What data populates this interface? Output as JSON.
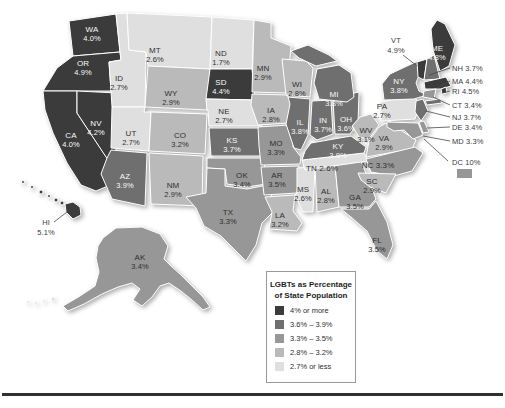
{
  "legend": {
    "title_line1": "LGBTs as Percentage",
    "title_line2": "of State Population",
    "items": [
      {
        "key": "cat1",
        "label": "4% or more",
        "color": "#3b3b3b"
      },
      {
        "key": "cat2",
        "label": "3.6% – 3.9%",
        "color": "#6f6f6f"
      },
      {
        "key": "cat3",
        "label": "3.3% – 3.5%",
        "color": "#979797"
      },
      {
        "key": "cat4",
        "label": "2.8% – 3.2%",
        "color": "#bababa"
      },
      {
        "key": "cat5",
        "label": "2.7% or less",
        "color": "#dfdfdf"
      }
    ]
  },
  "map": {
    "label_colors": {
      "on_dark": "#fafafa",
      "on_light": "#2f2f2f"
    },
    "states": [
      {
        "abbr": "WA",
        "value": "4.0%",
        "category": "cat1",
        "label": {
          "x": 92,
          "y": 29
        }
      },
      {
        "abbr": "OR",
        "value": "4.9%",
        "category": "cat1",
        "label": {
          "x": 83,
          "y": 63
        }
      },
      {
        "abbr": "CA",
        "value": "4.0%",
        "category": "cat1",
        "label": {
          "x": 71,
          "y": 135
        }
      },
      {
        "abbr": "NV",
        "value": "4.2%",
        "category": "cat1",
        "label": {
          "x": 96,
          "y": 123
        }
      },
      {
        "abbr": "ID",
        "value": "2.7%",
        "category": "cat5",
        "label": {
          "x": 119,
          "y": 78
        }
      },
      {
        "abbr": "UT",
        "value": "2.7%",
        "category": "cat5",
        "label": {
          "x": 131,
          "y": 133
        }
      },
      {
        "abbr": "AZ",
        "value": "3.9%",
        "category": "cat2",
        "label": {
          "x": 125,
          "y": 176
        }
      },
      {
        "abbr": "MT",
        "value": "2.6%",
        "category": "cat5",
        "label": {
          "x": 155,
          "y": 50
        }
      },
      {
        "abbr": "WY",
        "value": "2.9%",
        "category": "cat4",
        "label": {
          "x": 171,
          "y": 93
        }
      },
      {
        "abbr": "CO",
        "value": "3.2%",
        "category": "cat4",
        "label": {
          "x": 180,
          "y": 135
        }
      },
      {
        "abbr": "NM",
        "value": "2.9%",
        "category": "cat4",
        "label": {
          "x": 173,
          "y": 185
        }
      },
      {
        "abbr": "ND",
        "value": "1.7%",
        "category": "cat5",
        "label": {
          "x": 221,
          "y": 53
        }
      },
      {
        "abbr": "SD",
        "value": "4.4%",
        "category": "cat1",
        "label": {
          "x": 221,
          "y": 82
        }
      },
      {
        "abbr": "NE",
        "value": "2.7%",
        "category": "cat5",
        "label": {
          "x": 224,
          "y": 111
        }
      },
      {
        "abbr": "KS",
        "value": "3.7%",
        "category": "cat2",
        "label": {
          "x": 232,
          "y": 140
        }
      },
      {
        "abbr": "OK",
        "value": "3.4%",
        "category": "cat3",
        "label": {
          "x": 242,
          "y": 175
        }
      },
      {
        "abbr": "TX",
        "value": "3.3%",
        "category": "cat3",
        "label": {
          "x": 228,
          "y": 212
        }
      },
      {
        "abbr": "MN",
        "value": "2.9%",
        "category": "cat4",
        "label": {
          "x": 263,
          "y": 68
        }
      },
      {
        "abbr": "IA",
        "value": "2.8%",
        "category": "cat4",
        "label": {
          "x": 271,
          "y": 110
        }
      },
      {
        "abbr": "MO",
        "value": "3.3%",
        "category": "cat3",
        "label": {
          "x": 276,
          "y": 143
        }
      },
      {
        "abbr": "AR",
        "value": "3.5%",
        "category": "cat3",
        "label": {
          "x": 277,
          "y": 175
        }
      },
      {
        "abbr": "LA",
        "value": "3.2%",
        "category": "cat4",
        "label": {
          "x": 280,
          "y": 215
        }
      },
      {
        "abbr": "WI",
        "value": "2.8%",
        "category": "cat4",
        "label": {
          "x": 297,
          "y": 84
        }
      },
      {
        "abbr": "IL",
        "value": "3.8%",
        "category": "cat2",
        "label": {
          "x": 300,
          "y": 122
        }
      },
      {
        "abbr": "IN",
        "value": "3.7%",
        "category": "cat2",
        "label": {
          "x": 323,
          "y": 120
        }
      },
      {
        "abbr": "OH",
        "value": "3.6%",
        "category": "cat2",
        "label": {
          "x": 346,
          "y": 119
        }
      },
      {
        "abbr": "MI",
        "value": "3.8%",
        "category": "cat2",
        "label": {
          "x": 334,
          "y": 94
        }
      },
      {
        "abbr": "KY",
        "value": "3.9%",
        "category": "cat2",
        "label": {
          "x": 338,
          "y": 146
        }
      },
      {
        "abbr": "TN",
        "value": "2.6%",
        "category": "cat5",
        "label": {
          "x": 322,
          "y": 168,
          "inline": true
        }
      },
      {
        "abbr": "MS",
        "value": "2.6%",
        "category": "cat5",
        "label": {
          "x": 303,
          "y": 189
        }
      },
      {
        "abbr": "AL",
        "value": "2.8%",
        "category": "cat4",
        "label": {
          "x": 326,
          "y": 191
        }
      },
      {
        "abbr": "GA",
        "value": "3.5%",
        "category": "cat3",
        "label": {
          "x": 355,
          "y": 197
        }
      },
      {
        "abbr": "FL",
        "value": "3.5%",
        "category": "cat3",
        "label": {
          "x": 377,
          "y": 240
        }
      },
      {
        "abbr": "WV",
        "value": "3.1%",
        "category": "cat4",
        "label": {
          "x": 366,
          "y": 130
        }
      },
      {
        "abbr": "VA",
        "value": "2.9%",
        "category": "cat4",
        "label": {
          "x": 384,
          "y": 138
        }
      },
      {
        "abbr": "NC",
        "value": "3.3%",
        "category": "cat3",
        "label": {
          "x": 378,
          "y": 165,
          "inline": true
        }
      },
      {
        "abbr": "SC",
        "value": "2.9%",
        "category": "cat4",
        "label": {
          "x": 372,
          "y": 181
        }
      },
      {
        "abbr": "PA",
        "value": "2.7%",
        "category": "cat5",
        "label": {
          "x": 382,
          "y": 106
        }
      },
      {
        "abbr": "NY",
        "value": "3.8%",
        "category": "cat2",
        "label": {
          "x": 399,
          "y": 81
        }
      },
      {
        "abbr": "ME",
        "value": "4.8%",
        "category": "cat1",
        "label": {
          "x": 437,
          "y": 48
        }
      },
      {
        "abbr": "AK",
        "value": "3.4%",
        "category": "cat3",
        "label": {
          "x": 140,
          "y": 257
        }
      },
      {
        "abbr": "HI",
        "value": "5.1%",
        "category": "cat1",
        "label": null
      },
      {
        "abbr": "VT",
        "value": "4.9%",
        "category": "cat1",
        "label": null
      },
      {
        "abbr": "NH",
        "value": "3.7%",
        "category": "cat2",
        "label": null
      },
      {
        "abbr": "MA",
        "value": "4.4%",
        "category": "cat1",
        "label": null
      },
      {
        "abbr": "RI",
        "value": "4.5%",
        "category": "cat1",
        "label": null
      },
      {
        "abbr": "CT",
        "value": "3.4%",
        "category": "cat3",
        "label": null
      },
      {
        "abbr": "NJ",
        "value": "3.7%",
        "category": "cat2",
        "label": null
      },
      {
        "abbr": "DE",
        "value": "3.4%",
        "category": "cat3",
        "label": null
      },
      {
        "abbr": "MD",
        "value": "3.3%",
        "category": "cat3",
        "label": null
      }
    ],
    "callouts": [
      {
        "abbr": "VT",
        "value": "4.9%",
        "x": 396,
        "y": 43,
        "align": "middle",
        "two_line": true,
        "line": [
          403,
          55,
          417,
          66
        ]
      },
      {
        "abbr": "HI",
        "value": "5.1%",
        "x": 46,
        "y": 225,
        "align": "middle",
        "two_line": true,
        "line": [
          54,
          222,
          67,
          212
        ]
      },
      {
        "abbr": "NH",
        "value": "3.7%",
        "x": 452,
        "y": 71,
        "align": "start",
        "two_line": false,
        "line": [
          450,
          68,
          429,
          75
        ]
      },
      {
        "abbr": "MA",
        "value": "4.4%",
        "x": 452,
        "y": 84,
        "align": "start",
        "two_line": false,
        "line": [
          450,
          81,
          437,
          88
        ]
      },
      {
        "abbr": "RI",
        "value": "4.5%",
        "x": 452,
        "y": 94,
        "align": "start",
        "two_line": false,
        "line": [
          450,
          91,
          442,
          93
        ]
      },
      {
        "abbr": "CT",
        "value": "3.4%",
        "x": 452,
        "y": 108,
        "align": "start",
        "two_line": false,
        "line": [
          450,
          105,
          433,
          97
        ]
      },
      {
        "abbr": "NJ",
        "value": "3.7%",
        "x": 452,
        "y": 120,
        "align": "start",
        "two_line": false,
        "line": [
          450,
          117,
          426,
          111
        ]
      },
      {
        "abbr": "DE",
        "value": "3.4%",
        "x": 452,
        "y": 130,
        "align": "start",
        "two_line": false,
        "line": [
          450,
          127,
          427,
          128
        ]
      },
      {
        "abbr": "MD",
        "value": "3.3%",
        "x": 452,
        "y": 144,
        "align": "start",
        "two_line": false,
        "line": [
          450,
          141,
          423,
          136
        ]
      },
      {
        "abbr": "DC",
        "value": "10%",
        "x": 452,
        "y": 165,
        "align": "start",
        "two_line": false,
        "line": [
          448,
          161,
          424,
          139
        ],
        "swatch": {
          "x": 457,
          "y": 169,
          "w": 15,
          "h": 9,
          "color": "#979797"
        }
      }
    ]
  },
  "footer": {
    "rule_color": "#303030"
  }
}
